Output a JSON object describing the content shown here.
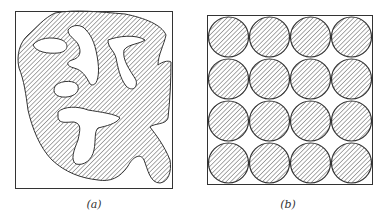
{
  "figure": {
    "panels": [
      {
        "id": "a",
        "caption": "(a)",
        "description": "irregular hatched region with voids inside a rectangular frame"
      },
      {
        "id": "b",
        "caption": "(b)",
        "description": "4x4 grid of hatched circles inside a square frame"
      }
    ],
    "colors": {
      "line": "#333333",
      "hatch": "#555555",
      "background": "#ffffff"
    },
    "grid": {
      "rows": 4,
      "cols": 4
    }
  }
}
